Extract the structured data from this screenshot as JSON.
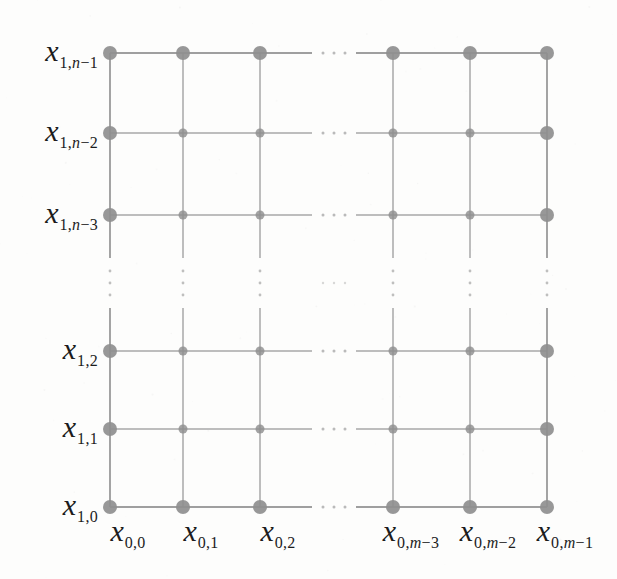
{
  "figure": {
    "name": "grid-lattice-diagram",
    "background_color": "#fdfdfc",
    "line_color": "#9a9a9a",
    "node_color": "#8f8f8f",
    "label_color": "#1c1c1c"
  },
  "chart_data": {
    "type": "scatter",
    "title": "",
    "xlabel": "",
    "ylabel": "",
    "grid": true,
    "legend": null,
    "x_positions": [
      110,
      183,
      260,
      393,
      470,
      547
    ],
    "y_positions": [
      53,
      133,
      215,
      351,
      429,
      507
    ],
    "column_count_visible": 6,
    "row_count_visible": 6,
    "x_gap_between": [
      260,
      393
    ],
    "y_gap_between": [
      215,
      351
    ],
    "boundary_node_radius": 7,
    "interior_node_radius": 4.5,
    "x": [
      110,
      183,
      260,
      393,
      470,
      547
    ],
    "y": [
      53,
      133,
      215,
      351,
      429,
      507
    ]
  },
  "row_labels": [
    {
      "var": "x",
      "sub_prefix": "1,",
      "sub_italic": "n",
      "sub_suffix": "−1",
      "y": 53
    },
    {
      "var": "x",
      "sub_prefix": "1,",
      "sub_italic": "n",
      "sub_suffix": "−2",
      "y": 133
    },
    {
      "var": "x",
      "sub_prefix": "1,",
      "sub_italic": "n",
      "sub_suffix": "−3",
      "y": 215
    },
    {
      "var": "x",
      "sub_prefix": "1,2",
      "sub_italic": "",
      "sub_suffix": "",
      "y": 351
    },
    {
      "var": "x",
      "sub_prefix": "1,1",
      "sub_italic": "",
      "sub_suffix": "",
      "y": 429
    },
    {
      "var": "x",
      "sub_prefix": "1,0",
      "sub_italic": "",
      "sub_suffix": "",
      "y": 507
    }
  ],
  "column_labels": [
    {
      "var": "x",
      "sub_prefix": "0,0",
      "sub_italic": "",
      "sub_suffix": "",
      "x": 110
    },
    {
      "var": "x",
      "sub_prefix": "0,1",
      "sub_italic": "",
      "sub_suffix": "",
      "x": 183
    },
    {
      "var": "x",
      "sub_prefix": "0,2",
      "sub_italic": "",
      "sub_suffix": "",
      "x": 260
    },
    {
      "var": "x",
      "sub_prefix": "0,",
      "sub_italic": "m",
      "sub_suffix": "−3",
      "x": 393
    },
    {
      "var": "x",
      "sub_prefix": "0,",
      "sub_italic": "m",
      "sub_suffix": "−2",
      "x": 470
    },
    {
      "var": "x",
      "sub_prefix": "0,",
      "sub_italic": "m",
      "sub_suffix": "−1",
      "x": 547
    }
  ],
  "ellipses": {
    "horizontal_dots": 3,
    "vertical_dots": 3,
    "horizontal_gap_x": [
      312,
      356
    ],
    "vertical_gap_y": [
      258,
      308
    ]
  }
}
